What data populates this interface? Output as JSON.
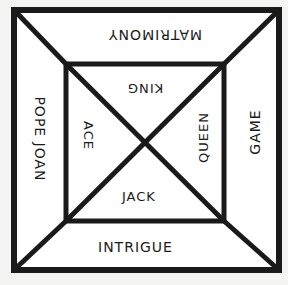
{
  "diagram": {
    "colors": {
      "line": "#1a1a1a",
      "background": "#f4f4f2",
      "fill": "#ffffff"
    },
    "outer_square": {
      "x1": 14,
      "y1": 10,
      "x2": 279,
      "y2": 270
    },
    "inner_square": {
      "x1": 66,
      "y1": 64,
      "x2": 224,
      "y2": 221
    },
    "center": {
      "x": 146,
      "y": 143
    },
    "sections": {
      "top": "MATRIMONY",
      "left": "POPE JOAN",
      "right": "GAME",
      "bottom": "INTRIGUE",
      "inner_top": "KING",
      "inner_left": "ACE",
      "inner_right": "QUEEN",
      "inner_bottom": "JACK"
    }
  }
}
